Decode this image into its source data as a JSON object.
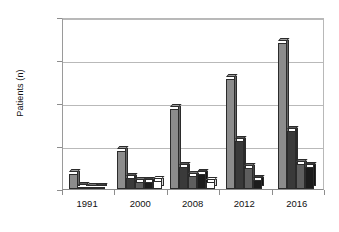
{
  "chart_data": {
    "type": "bar",
    "title": "",
    "subtitle": "",
    "xlabel": "",
    "ylabel": "Patients (n)",
    "categories": [
      "1991",
      "2000",
      "2008",
      "2012",
      "2016"
    ],
    "ylim": [
      0,
      2000
    ],
    "ytick_labels": [
      "0",
      "500",
      "1000",
      "1500",
      "2000"
    ],
    "ytick_values": [
      0,
      500,
      1000,
      1500,
      2000
    ],
    "grid": true,
    "legend": "none",
    "legend_position": "none",
    "series": [
      {
        "name": "Series 1",
        "color": "#8c8c8c",
        "values": [
          170,
          440,
          930,
          1280,
          1700
        ]
      },
      {
        "name": "Series 2",
        "color": "#3a3a3a",
        "values": [
          25,
          130,
          255,
          555,
          680
        ]
      },
      {
        "name": "Series 3",
        "color": "#5e5e5e",
        "values": [
          10,
          80,
          150,
          240,
          290
        ]
      },
      {
        "name": "Series 4",
        "color": "#1c1c1c",
        "values": [
          5,
          85,
          180,
          110,
          260
        ]
      },
      {
        "name": "Series 5",
        "color": "#ffffff",
        "values": [
          0,
          95,
          80,
          0,
          0
        ]
      }
    ],
    "groups": [
      {
        "label": "1991",
        "bars": [
          {
            "value": 170,
            "fill": "#8c8c8c"
          },
          {
            "value": 25,
            "fill": "#3a3a3a"
          },
          {
            "value": 10,
            "fill": "#5e5e5e"
          },
          {
            "value": 5,
            "fill": "#1c1c1c"
          }
        ]
      },
      {
        "label": "2000",
        "bars": [
          {
            "value": 440,
            "fill": "#8c8c8c"
          },
          {
            "value": 130,
            "fill": "#3a3a3a"
          },
          {
            "value": 80,
            "fill": "#5e5e5e"
          },
          {
            "value": 85,
            "fill": "#1c1c1c"
          },
          {
            "value": 95,
            "fill": "#ffffff"
          }
        ]
      },
      {
        "label": "2008",
        "bars": [
          {
            "value": 930,
            "fill": "#8c8c8c"
          },
          {
            "value": 255,
            "fill": "#3a3a3a"
          },
          {
            "value": 150,
            "fill": "#5e5e5e"
          },
          {
            "value": 180,
            "fill": "#1c1c1c"
          },
          {
            "value": 80,
            "fill": "#ffffff"
          }
        ]
      },
      {
        "label": "2012",
        "bars": [
          {
            "value": 1280,
            "fill": "#8c8c8c"
          },
          {
            "value": 555,
            "fill": "#3a3a3a"
          },
          {
            "value": 240,
            "fill": "#5e5e5e"
          },
          {
            "value": 110,
            "fill": "#1c1c1c"
          }
        ]
      },
      {
        "label": "2016",
        "bars": [
          {
            "value": 1700,
            "fill": "#8c8c8c"
          },
          {
            "value": 680,
            "fill": "#3a3a3a"
          },
          {
            "value": 290,
            "fill": "#5e5e5e"
          },
          {
            "value": 260,
            "fill": "#1c1c1c"
          }
        ]
      }
    ]
  },
  "axis": {
    "y_title": "Patients (n)",
    "y_ticks": [
      "2000",
      "1500",
      "1000",
      "500",
      "0"
    ],
    "x_ticks": [
      "1991",
      "2000",
      "2008",
      "2012",
      "2016"
    ]
  },
  "style": {
    "plot_background": "#ffffff",
    "grid_color": "#b9b9b9",
    "axis_color": "#8d8d8d",
    "text_color": "#111111"
  }
}
